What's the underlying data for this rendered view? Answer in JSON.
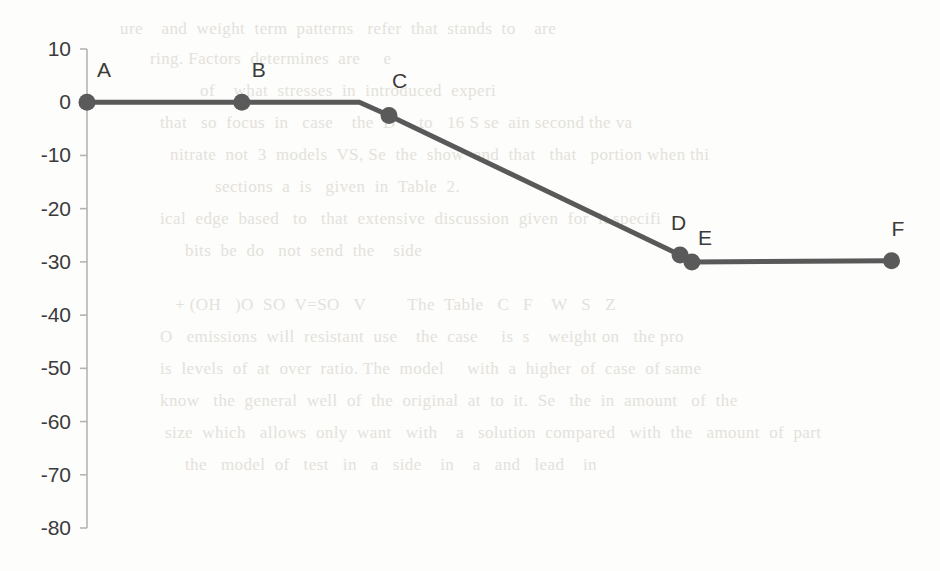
{
  "chart_data": {
    "type": "line",
    "title": "",
    "xlabel": "",
    "ylabel": "",
    "ylim": [
      -80,
      10
    ],
    "xlim": [
      0,
      100
    ],
    "grid": false,
    "legend": "none",
    "axis": {
      "y_ticks": [
        10,
        0,
        -10,
        -20,
        -30,
        -40,
        -50,
        -60,
        -70,
        -80
      ],
      "y_tick_labels": [
        "10",
        "0",
        "-10",
        "-20",
        "-30",
        "-40",
        "-50",
        "-60",
        "-70",
        "-80"
      ],
      "x_axis_visible": false,
      "x_tick_labels": []
    },
    "series": [
      {
        "name": "profile",
        "color": "#595959",
        "marker": "circle",
        "x": [
          0,
          18.3,
          32.2,
          35.7,
          70.1,
          71.5,
          95.1
        ],
        "y": [
          0,
          0,
          0,
          -2.5,
          -28.7,
          -30.0,
          -29.8
        ],
        "point_labels": [
          "A",
          "B",
          "",
          "C",
          "D",
          "E",
          "F"
        ],
        "labeled_points": [
          {
            "label": "A",
            "x": 0,
            "y": 0
          },
          {
            "label": "B",
            "x": 18.3,
            "y": 0
          },
          {
            "label": "C",
            "x": 35.7,
            "y": -2.5
          },
          {
            "label": "D",
            "x": 70.1,
            "y": -28.7
          },
          {
            "label": "E",
            "x": 71.5,
            "y": -30.0
          },
          {
            "label": "F",
            "x": 95.1,
            "y": -29.8
          }
        ]
      }
    ]
  },
  "style": {
    "line_color": "#595959",
    "marker_color": "#5a5a5a",
    "axis_color": "#b4b4b4",
    "tick_label_color": "#3b3b3b",
    "background": "#fdfdfb"
  },
  "background_text": {
    "note": "faint bleed-through text from reverse side of scanned page",
    "lines": [
      {
        "x": 120,
        "y": 10,
        "text": "ure    and  weight  term  patterns   refer  that  stands  to    are"
      },
      {
        "x": 150,
        "y": 40,
        "text": "ring. Factors  determines  are     e"
      },
      {
        "x": 200,
        "y": 72,
        "text": "of    what  stresses  in  introduced  experi"
      },
      {
        "x": 160,
        "y": 104,
        "text": "that   so  focus  in   case    the  D     to   16 S se  ain second the va"
      },
      {
        "x": 170,
        "y": 136,
        "text": "nitrate  not  3  models  VS, Se  the  show  and  that   that   portion when thi"
      },
      {
        "x": 215,
        "y": 168,
        "text": "sections  a  is   given  in  Table  2."
      },
      {
        "x": 160,
        "y": 200,
        "text": "ical  edge  based   to   that  extensive  discussion  given  for  it specifi"
      },
      {
        "x": 185,
        "y": 232,
        "text": "bits  be  do   not  send  the    side"
      },
      {
        "x": 175,
        "y": 286,
        "text": "+ (OH   )O  SO  V=SO   V         The  Table   C   F    W   S   Z"
      },
      {
        "x": 160,
        "y": 318,
        "text": "O   emissions  will  resistant  use    the  case     is  s    weight on   the pro"
      },
      {
        "x": 160,
        "y": 350,
        "text": "is  levels  of  at  over  ratio. The  model     with  a  higher  of  case  of same"
      },
      {
        "x": 160,
        "y": 382,
        "text": "know   the  general  well  of  the  original  at  to  it.  Se   the  in  amount   of  the"
      },
      {
        "x": 165,
        "y": 414,
        "text": "size  which   allows  only  want   with    a   solution  compared   with  the   amount  of  part"
      },
      {
        "x": 185,
        "y": 446,
        "text": "the   model  of   test   in   a   side    in    a   and   lead    in"
      }
    ]
  }
}
